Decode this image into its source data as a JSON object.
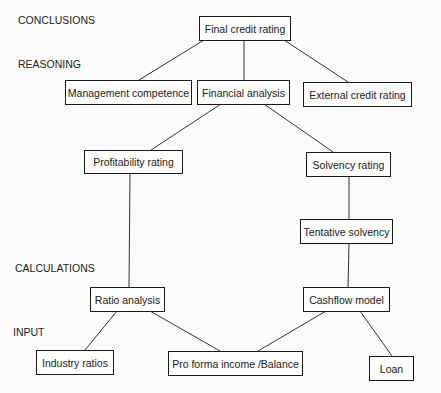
{
  "levels": {
    "conclusions": "CONCLUSIONS",
    "reasoning": "REASONING",
    "calculations": "CALCULATIONS",
    "input": "INPUT"
  },
  "nodes": {
    "final_credit_rating": "Final credit rating",
    "management_competence": "Management competence",
    "financial_analysis": "Financial analysis",
    "external_credit_rating": "External credit rating",
    "profitability_rating": "Profitability rating",
    "solvency_rating": "Solvency rating",
    "tentative_solvency": "Tentative solvency",
    "ratio_analysis": "Ratio analysis",
    "cashflow_model": "Cashflow model",
    "industry_ratios": "Industry ratios",
    "pro_forma": "Pro forma income /Balance",
    "loan": "Loan"
  },
  "edges": [
    [
      "final_credit_rating",
      "management_competence"
    ],
    [
      "final_credit_rating",
      "financial_analysis"
    ],
    [
      "final_credit_rating",
      "external_credit_rating"
    ],
    [
      "financial_analysis",
      "profitability_rating"
    ],
    [
      "financial_analysis",
      "solvency_rating"
    ],
    [
      "profitability_rating",
      "ratio_analysis"
    ],
    [
      "solvency_rating",
      "tentative_solvency"
    ],
    [
      "tentative_solvency",
      "cashflow_model"
    ],
    [
      "ratio_analysis",
      "industry_ratios"
    ],
    [
      "ratio_analysis",
      "pro_forma"
    ],
    [
      "cashflow_model",
      "pro_forma"
    ],
    [
      "cashflow_model",
      "loan"
    ]
  ]
}
